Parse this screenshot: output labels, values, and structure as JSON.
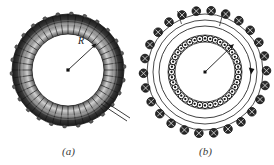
{
  "figure": {
    "panels": [
      {
        "id": "a",
        "caption": "(a)",
        "description": "toroid-3d-view",
        "labels": [
          {
            "name": "radius-label",
            "text": "R"
          }
        ]
      },
      {
        "id": "b",
        "caption": "(b)",
        "description": "toroid-cross-section-view",
        "labels": [
          {
            "name": "amperian-loop-label",
            "text": "L"
          },
          {
            "name": "point-label",
            "text": "P"
          },
          {
            "name": "center-label",
            "text": "O"
          },
          {
            "name": "radius-label",
            "text": "r"
          }
        ]
      }
    ]
  },
  "colors": {
    "background": "#ffffff",
    "ink": "#1a1a1a",
    "coil_dark": "#3b3b3b",
    "coil_mid": "#8a8a8a",
    "coil_light": "#d8d8d8",
    "caption": "#3a3a3a"
  }
}
